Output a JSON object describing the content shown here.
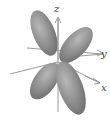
{
  "diagram": {
    "axes": {
      "z": "z",
      "y": "y",
      "x": "x"
    },
    "colors": {
      "lobe": "#8e8e8e",
      "lobe_highlight": "#b5b5b5",
      "axis": "#9a9a9a",
      "label": "#444444",
      "background": "#ffffff"
    }
  }
}
